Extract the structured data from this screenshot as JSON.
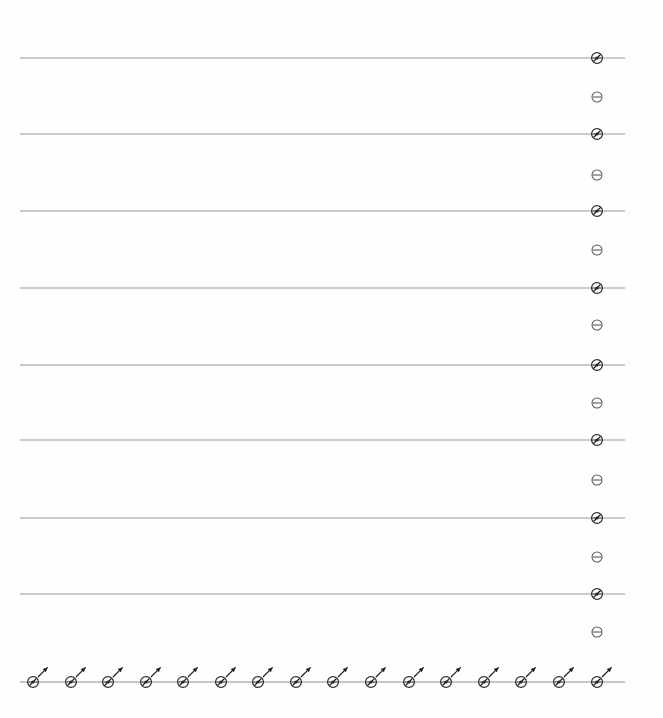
{
  "figure": {
    "background_color": "#fefefe",
    "width": 663,
    "height": 718
  },
  "chart_data": {
    "type": "scatter",
    "title": "",
    "subtitle": "",
    "xlabel": "",
    "ylabel": "",
    "grid": true,
    "legend_position": "none",
    "axis_color": "#8f8f8f",
    "gridline_color": "#8c8c8c",
    "marker_stroke_color": "#2b2b2b",
    "arrow_color": "#1c1c1c",
    "plot_area": {
      "left": 20,
      "right": 625,
      "top": 58,
      "bottom": 682,
      "column_x": 597,
      "row_y": 682
    },
    "marker_geometry": {
      "radius": 5.4,
      "light_radius": 5.0,
      "arrow_length": 13,
      "arrow_angle_degrees": 45
    },
    "vertical_axis": {
      "label": "right node column",
      "count": 16,
      "x": 597,
      "spacing": 41.6,
      "items": [
        {
          "index": 0,
          "y": 58,
          "style": "dark",
          "gridline": true
        },
        {
          "index": 1,
          "y": 97,
          "style": "light",
          "gridline": false
        },
        {
          "index": 2,
          "y": 134,
          "style": "dark",
          "gridline": true
        },
        {
          "index": 3,
          "y": 175,
          "style": "light",
          "gridline": false
        },
        {
          "index": 4,
          "y": 211,
          "style": "dark",
          "gridline": true
        },
        {
          "index": 5,
          "y": 250,
          "style": "light",
          "gridline": false
        },
        {
          "index": 6,
          "y": 288,
          "style": "dark",
          "gridline": true
        },
        {
          "index": 7,
          "y": 325,
          "style": "light",
          "gridline": false
        },
        {
          "index": 8,
          "y": 365,
          "style": "dark",
          "gridline": true
        },
        {
          "index": 9,
          "y": 403,
          "style": "light",
          "gridline": false
        },
        {
          "index": 10,
          "y": 440,
          "style": "dark",
          "gridline": true
        },
        {
          "index": 11,
          "y": 480,
          "style": "light",
          "gridline": false
        },
        {
          "index": 12,
          "y": 518,
          "style": "dark",
          "gridline": true
        },
        {
          "index": 13,
          "y": 557,
          "style": "light",
          "gridline": false
        },
        {
          "index": 14,
          "y": 594,
          "style": "dark",
          "gridline": true
        },
        {
          "index": 15,
          "y": 632,
          "style": "light",
          "gridline": false
        }
      ]
    },
    "horizontal_axis": {
      "label": "bottom node row",
      "count": 16,
      "y": 682,
      "spacing": 37.6,
      "all_have_arrows": true,
      "items": [
        {
          "index": 0,
          "x": 33,
          "style": "dark",
          "arrow": true
        },
        {
          "index": 1,
          "x": 71,
          "style": "dark",
          "arrow": true
        },
        {
          "index": 2,
          "x": 108,
          "style": "dark",
          "arrow": true
        },
        {
          "index": 3,
          "x": 146,
          "style": "dark",
          "arrow": true
        },
        {
          "index": 4,
          "x": 183,
          "style": "dark",
          "arrow": true
        },
        {
          "index": 5,
          "x": 221,
          "style": "dark",
          "arrow": true
        },
        {
          "index": 6,
          "x": 258,
          "style": "dark",
          "arrow": true
        },
        {
          "index": 7,
          "x": 296,
          "style": "dark",
          "arrow": true
        },
        {
          "index": 8,
          "x": 333,
          "style": "dark",
          "arrow": true
        },
        {
          "index": 9,
          "x": 371,
          "style": "dark",
          "arrow": true
        },
        {
          "index": 10,
          "x": 409,
          "style": "dark",
          "arrow": true
        },
        {
          "index": 11,
          "x": 446,
          "style": "dark",
          "arrow": true
        },
        {
          "index": 12,
          "x": 484,
          "style": "dark",
          "arrow": true
        },
        {
          "index": 13,
          "x": 521,
          "style": "dark",
          "arrow": true
        },
        {
          "index": 14,
          "x": 559,
          "style": "dark",
          "arrow": true
        },
        {
          "index": 15,
          "x": 597,
          "style": "dark",
          "arrow": true
        }
      ]
    },
    "gridlines": [
      {
        "index": 0,
        "y": 58,
        "x_start": 20,
        "x_end": 625
      },
      {
        "index": 1,
        "y": 134,
        "x_start": 20,
        "x_end": 625
      },
      {
        "index": 2,
        "y": 211,
        "x_start": 20,
        "x_end": 625
      },
      {
        "index": 3,
        "y": 288,
        "x_start": 20,
        "x_end": 625
      },
      {
        "index": 4,
        "y": 365,
        "x_start": 20,
        "x_end": 625
      },
      {
        "index": 5,
        "y": 440,
        "x_start": 20,
        "x_end": 625
      },
      {
        "index": 6,
        "y": 518,
        "x_start": 20,
        "x_end": 625
      },
      {
        "index": 7,
        "y": 594,
        "x_start": 20,
        "x_end": 625
      }
    ],
    "baseline": {
      "y": 682,
      "x_start": 20,
      "x_end": 625
    }
  }
}
